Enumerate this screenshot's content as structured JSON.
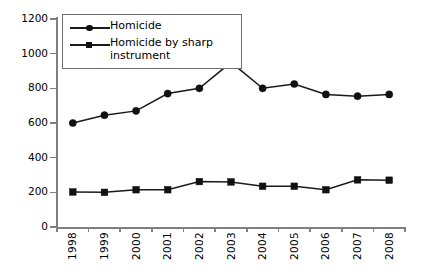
{
  "chart_data": {
    "type": "line",
    "title": "",
    "xlabel": "",
    "ylabel": "",
    "categories": [
      "1998",
      "1999",
      "2000",
      "2001",
      "2002",
      "2003",
      "2004",
      "2005",
      "2006",
      "2007",
      "2008"
    ],
    "ylim": [
      0,
      1200
    ],
    "yticks": [
      0,
      200,
      400,
      600,
      800,
      1000,
      1200
    ],
    "ytick_labels": [
      "0",
      "200",
      "400",
      "600",
      "800",
      "1000",
      "1200"
    ],
    "grid": false,
    "legend_position": "upper left",
    "series": [
      {
        "name": "Homicide",
        "marker": "circle",
        "values": [
          600,
          645,
          670,
          770,
          800,
          950,
          800,
          825,
          765,
          755,
          765
        ]
      },
      {
        "name": "Homicide by sharp instrument",
        "marker": "square",
        "values": [
          202,
          200,
          215,
          215,
          262,
          260,
          235,
          235,
          215,
          272,
          270
        ]
      }
    ]
  },
  "legend": {
    "items": [
      {
        "label": "Homicide"
      },
      {
        "label": "Homicide by sharp instrument"
      }
    ]
  },
  "colors": {
    "series_line": "#1a1a1a",
    "marker": "#111111",
    "axis": "#808080",
    "legend_border": "#6e6e6e",
    "background": "#ffffff"
  }
}
